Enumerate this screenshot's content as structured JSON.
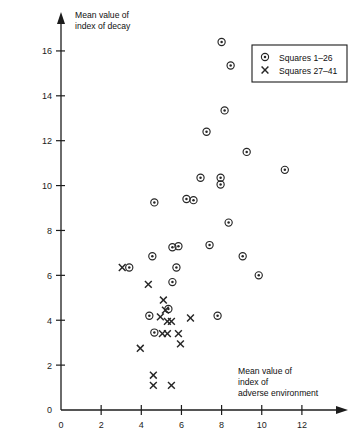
{
  "chart_data": {
    "type": "scatter",
    "title": "",
    "xlabel": "Mean value of index of adverse environment",
    "xlabel_lines": [
      "Mean value of",
      "index of",
      "adverse environment"
    ],
    "ylabel": "Mean value of index of decay",
    "ylabel_lines": [
      "Mean value of",
      "index of decay"
    ],
    "xlim": [
      0,
      13.4
    ],
    "ylim": [
      0,
      17.2
    ],
    "xticks": [
      0,
      2,
      4,
      6,
      8,
      10,
      12
    ],
    "yticks": [
      0,
      2,
      4,
      6,
      8,
      10,
      12,
      14,
      16
    ],
    "xtick_labels": [
      "0",
      "2",
      "4",
      "6",
      "8",
      "10",
      "12"
    ],
    "ytick_labels": [
      "0",
      "2",
      "4",
      "6",
      "8",
      "10",
      "12",
      "14",
      "16"
    ],
    "grid": false,
    "legend_position": "top-right",
    "marker_color": "#262626",
    "series": [
      {
        "name": "Squares 1–26",
        "marker": "circle-dot",
        "points": [
          [
            8.0,
            16.4
          ],
          [
            8.45,
            15.35
          ],
          [
            8.15,
            13.35
          ],
          [
            7.25,
            12.4
          ],
          [
            9.25,
            11.5
          ],
          [
            11.15,
            10.7
          ],
          [
            7.95,
            10.05
          ],
          [
            7.95,
            10.35
          ],
          [
            6.95,
            10.35
          ],
          [
            4.65,
            9.25
          ],
          [
            6.25,
            9.4
          ],
          [
            6.6,
            9.35
          ],
          [
            8.35,
            8.35
          ],
          [
            9.05,
            6.85
          ],
          [
            7.4,
            7.35
          ],
          [
            5.55,
            7.25
          ],
          [
            5.85,
            7.3
          ],
          [
            4.55,
            6.85
          ],
          [
            5.75,
            6.35
          ],
          [
            5.55,
            5.7
          ],
          [
            9.85,
            6.0
          ],
          [
            5.35,
            4.5
          ],
          [
            7.8,
            4.2
          ],
          [
            4.4,
            4.2
          ],
          [
            4.65,
            3.45
          ],
          [
            3.4,
            6.35
          ]
        ]
      },
      {
        "name": "Squares 27–41",
        "marker": "x",
        "points": [
          [
            3.05,
            6.35
          ],
          [
            4.35,
            5.6
          ],
          [
            5.1,
            4.9
          ],
          [
            5.2,
            4.45
          ],
          [
            4.95,
            4.15
          ],
          [
            5.3,
            3.95
          ],
          [
            5.5,
            3.95
          ],
          [
            6.45,
            4.1
          ],
          [
            5.05,
            3.4
          ],
          [
            5.3,
            3.4
          ],
          [
            5.85,
            3.4
          ],
          [
            5.95,
            2.95
          ],
          [
            3.95,
            2.75
          ],
          [
            4.6,
            1.55
          ],
          [
            4.6,
            1.1
          ],
          [
            5.5,
            1.1
          ]
        ]
      }
    ],
    "legend": [
      {
        "marker": "circle-dot",
        "label": "Squares 1–26"
      },
      {
        "marker": "x",
        "label": "Squares 27–41"
      }
    ]
  },
  "figure": {
    "background": "#ffffff",
    "axis_color": "#1c1c1c"
  }
}
